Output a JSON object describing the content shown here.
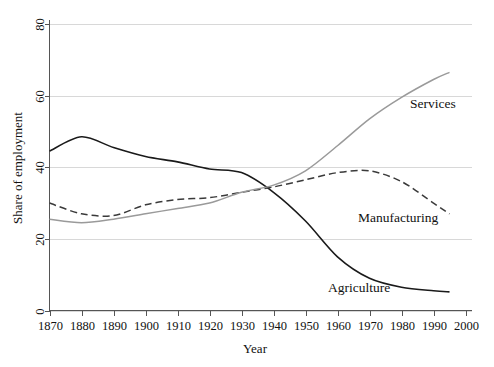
{
  "chart_data": {
    "type": "line",
    "title": "",
    "subtitle": "",
    "xlabel": "Year",
    "ylabel": "Share of employment",
    "xlim": [
      1870,
      2000
    ],
    "ylim": [
      0,
      80
    ],
    "xticks": [
      1870,
      1880,
      1890,
      1900,
      1910,
      1920,
      1930,
      1940,
      1950,
      1960,
      1970,
      1980,
      1990,
      2000
    ],
    "yticks": [
      0,
      20,
      40,
      60,
      80
    ],
    "grid": "horizontal",
    "legend": "inline-labels",
    "x": [
      1870,
      1880,
      1890,
      1900,
      1910,
      1920,
      1930,
      1940,
      1950,
      1960,
      1970,
      1980,
      1990,
      1995
    ],
    "series": [
      {
        "name": "Agriculture",
        "style": "solid",
        "color": "#1a1a1a",
        "width": 1.6,
        "label_x": 1955,
        "label_y": 8.5,
        "values": [
          44.5,
          48.5,
          45.5,
          43.0,
          41.5,
          39.5,
          38.5,
          33.0,
          25.0,
          15.0,
          9.0,
          6.5,
          5.5,
          5.2
        ]
      },
      {
        "name": "Manufacturing",
        "style": "dashed",
        "color": "#3a3a3a",
        "width": 1.5,
        "label_x": 1955,
        "label_y": 23.0,
        "values": [
          30.0,
          27.0,
          26.5,
          29.5,
          31.0,
          31.5,
          33.0,
          34.5,
          36.5,
          38.5,
          39.0,
          36.0,
          30.0,
          27.0
        ]
      },
      {
        "name": "Services",
        "style": "solid",
        "color": "#9a9a9a",
        "width": 1.5,
        "label_x": 1962,
        "label_y": 58.5,
        "values": [
          25.5,
          24.5,
          25.5,
          27.0,
          28.5,
          30.0,
          33.0,
          35.0,
          39.0,
          46.0,
          53.5,
          59.5,
          64.5,
          66.5
        ]
      }
    ]
  },
  "axes": {
    "x_tick_labels": [
      "1870",
      "1880",
      "1890",
      "1900",
      "1910",
      "1920",
      "1930",
      "1940",
      "1950",
      "1960",
      "1970",
      "1980",
      "1990",
      "2000"
    ],
    "y_tick_labels": [
      "0",
      "20",
      "40",
      "60",
      "80"
    ],
    "x_axis_title": "Year",
    "y_axis_title": "Share of employment"
  },
  "labels": {
    "services": "Services",
    "manufacturing": "Manufacturing",
    "agriculture": "Agriculture"
  },
  "colors": {
    "agriculture": "#1a1a1a",
    "manufacturing": "#3a3a3a",
    "services": "#9a9a9a",
    "grid": "#d8d8d8",
    "axis": "#555555",
    "background": "#ffffff"
  }
}
